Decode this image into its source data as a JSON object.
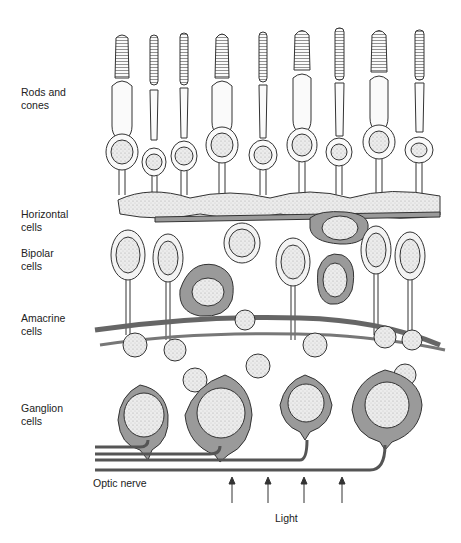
{
  "figure": {
    "labels": {
      "rods_cones": "Rods and\ncones",
      "horizontal": "Horizontal\ncells",
      "bipolar": "Bipolar\ncells",
      "amacrine": "Amacrine\ncells",
      "ganglion": "Ganglion\ncells",
      "optic_nerve": "Optic nerve",
      "light": "Light"
    },
    "colors": {
      "outline": "#333333",
      "cell_fill": "#f3f3f3",
      "dark_cell": "#9a9a9a",
      "nucleus": "#e6e6e6",
      "text": "#222222"
    },
    "photoreceptors": 9,
    "light_arrows": 4,
    "nerve_fibers": 4
  }
}
